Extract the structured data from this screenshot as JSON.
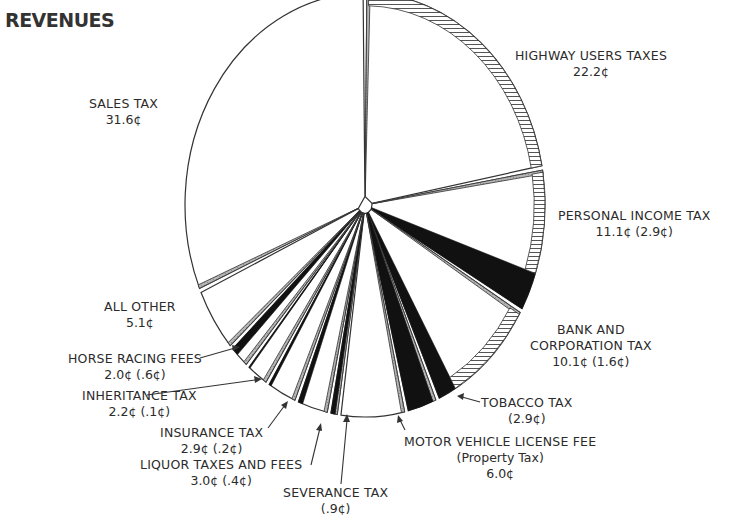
{
  "title": "REVENUES",
  "chart_data": {
    "type": "pie",
    "title": "REVENUES",
    "unit": "cents per dollar",
    "slices": [
      {
        "name": "HIGHWAY USERS TAXES",
        "value": 22.2,
        "sub_value": null,
        "value_label": "22.2¢"
      },
      {
        "name": "PERSONAL INCOME TAX",
        "value": 11.1,
        "sub_value": 2.9,
        "value_label": "11.1¢ (2.9¢)"
      },
      {
        "name": "BANK AND CORPORATION TAX",
        "value": 10.1,
        "sub_value": 1.6,
        "value_label": "10.1¢ (1.6¢)"
      },
      {
        "name": "TOBACCO TAX",
        "value": 2.9,
        "sub_value": 2.9,
        "value_label": "(2.9¢)"
      },
      {
        "name": "MOTOR VEHICLE LICENSE FEE (Property Tax)",
        "value": 6.0,
        "sub_value": null,
        "value_label": "6.0¢"
      },
      {
        "name": "SEVERANCE TAX",
        "value": 0.9,
        "sub_value": 0.9,
        "value_label": "(.9¢)"
      },
      {
        "name": "LIQUOR TAXES AND FEES",
        "value": 3.0,
        "sub_value": 0.4,
        "value_label": "3.0¢ (.4¢)"
      },
      {
        "name": "INSURANCE TAX",
        "value": 2.9,
        "sub_value": 0.2,
        "value_label": "2.9¢ (.2¢)"
      },
      {
        "name": "INHERITANCE TAX",
        "value": 2.2,
        "sub_value": 0.1,
        "value_label": "2.2¢ (.1¢)"
      },
      {
        "name": "HORSE RACING FEES",
        "value": 2.0,
        "sub_value": 0.6,
        "value_label": "2.0¢ (.6¢)"
      },
      {
        "name": "ALL OTHER",
        "value": 5.1,
        "sub_value": null,
        "value_label": "5.1¢"
      },
      {
        "name": "SALES TAX",
        "value": 31.6,
        "sub_value": null,
        "value_label": "31.6¢"
      }
    ],
    "legend": "none (direct labels)"
  },
  "labels": {
    "highway": {
      "name": "HIGHWAY USERS TAXES",
      "value": "22.2¢"
    },
    "personal": {
      "name": "PERSONAL INCOME TAX",
      "value": "11.1¢ (2.9¢)"
    },
    "bank1": "BANK AND",
    "bank2": "CORPORATION TAX",
    "bank_value": "10.1¢ (1.6¢)",
    "tobacco": {
      "name": "TOBACCO TAX",
      "value": "(2.9¢)"
    },
    "motor": {
      "name": "MOTOR VEHICLE LICENSE FEE",
      "sub": "(Property Tax)",
      "value": "6.0¢"
    },
    "severance": {
      "name": "SEVERANCE TAX",
      "value": "(.9¢)"
    },
    "liquor": {
      "name": "LIQUOR TAXES AND FEES",
      "value": "3.0¢ (.4¢)"
    },
    "insurance": {
      "name": "INSURANCE TAX",
      "value": "2.9¢ (.2¢)"
    },
    "inheritance": {
      "name": "INHERITANCE TAX",
      "value": "2.2¢ (.1¢)"
    },
    "horse": {
      "name": "HORSE RACING FEES",
      "value": "2.0¢ (.6¢)"
    },
    "other": {
      "name": "ALL OTHER",
      "value": "5.1¢"
    },
    "sales": {
      "name": "SALES TAX",
      "value": "31.6¢"
    }
  }
}
